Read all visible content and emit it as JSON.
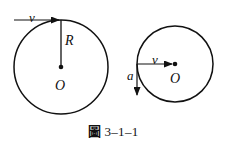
{
  "figure": {
    "caption_cjk": "圖",
    "caption_number": "3–1–1",
    "background_color": "#ffffff",
    "ink_color": "#111111",
    "left_diagram": {
      "name": "rolling-wheel-with-radius",
      "circle": {
        "cx": 61,
        "cy": 67,
        "r": 47
      },
      "center_label": "O",
      "radius_label": "R",
      "velocity_label": "v",
      "velocity_direction": "left",
      "radius_line": {
        "x1": 61,
        "y1": 20,
        "x2": 61,
        "y2": 67
      },
      "velocity_arrow": {
        "x1": 61,
        "y1": 20,
        "x2": 12,
        "y2": 20
      }
    },
    "right_diagram": {
      "name": "wheel-with-velocity-and-acceleration",
      "circle": {
        "cx": 175,
        "cy": 64,
        "r": 38
      },
      "center_label": "O",
      "velocity_label": "v",
      "velocity_direction": "right",
      "acceleration_label": "a",
      "acceleration_direction": "down",
      "velocity_arrow": {
        "x1": 137,
        "y1": 64,
        "x2": 175,
        "y2": 64
      },
      "acceleration_arrow": {
        "x1": 137,
        "y1": 64,
        "x2": 137,
        "y2": 99
      }
    }
  }
}
